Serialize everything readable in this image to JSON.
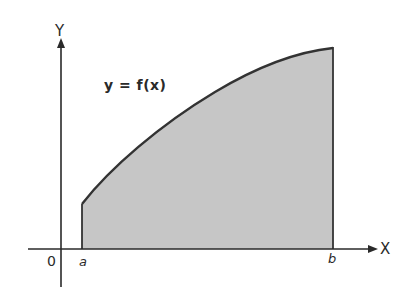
{
  "diagram": {
    "type": "area-under-curve",
    "axes": {
      "x_label": "X",
      "y_label": "Y",
      "origin_label": "0"
    },
    "function_label": "y = f(x)",
    "bounds": {
      "lower_label": "a",
      "upper_label": "b"
    },
    "colors": {
      "fill": "#c6c6c6",
      "stroke": "#333333",
      "axis": "#2a2a2a",
      "background": "#ffffff"
    }
  }
}
